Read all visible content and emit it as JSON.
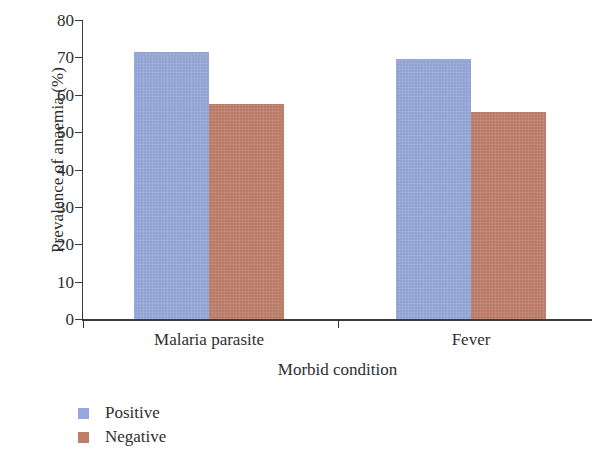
{
  "chart_data": {
    "type": "bar",
    "title": "",
    "xlabel": "Morbid condition",
    "ylabel": "Prevalence of anaemia (%)",
    "categories": [
      "Malaria parasite",
      "Fever"
    ],
    "series": [
      {
        "name": "Positive",
        "color": "#95A8DC",
        "values": [
          71.5,
          69.5
        ]
      },
      {
        "name": "Negative",
        "color": "#C07D68",
        "values": [
          57.5,
          55.5
        ]
      }
    ],
    "ylim": [
      0,
      80
    ],
    "yticks": [
      0,
      10,
      20,
      30,
      40,
      50,
      60,
      70,
      80
    ],
    "ytick_labels": [
      "0",
      "10",
      "20",
      "30",
      "40",
      "50",
      "60",
      "70",
      "80"
    ],
    "grid": false,
    "legend_position": "bottom-left",
    "legend_entries": [
      "Positive",
      "Negative"
    ]
  },
  "axes": {
    "y_title": "Prevalence of anaemia (%)",
    "x_title": "Morbid condition"
  },
  "legend": {
    "items": [
      {
        "label": "Positive",
        "swatch": "legend-swatch-positive"
      },
      {
        "label": "Negative",
        "swatch": "legend-swatch-negative"
      }
    ]
  }
}
